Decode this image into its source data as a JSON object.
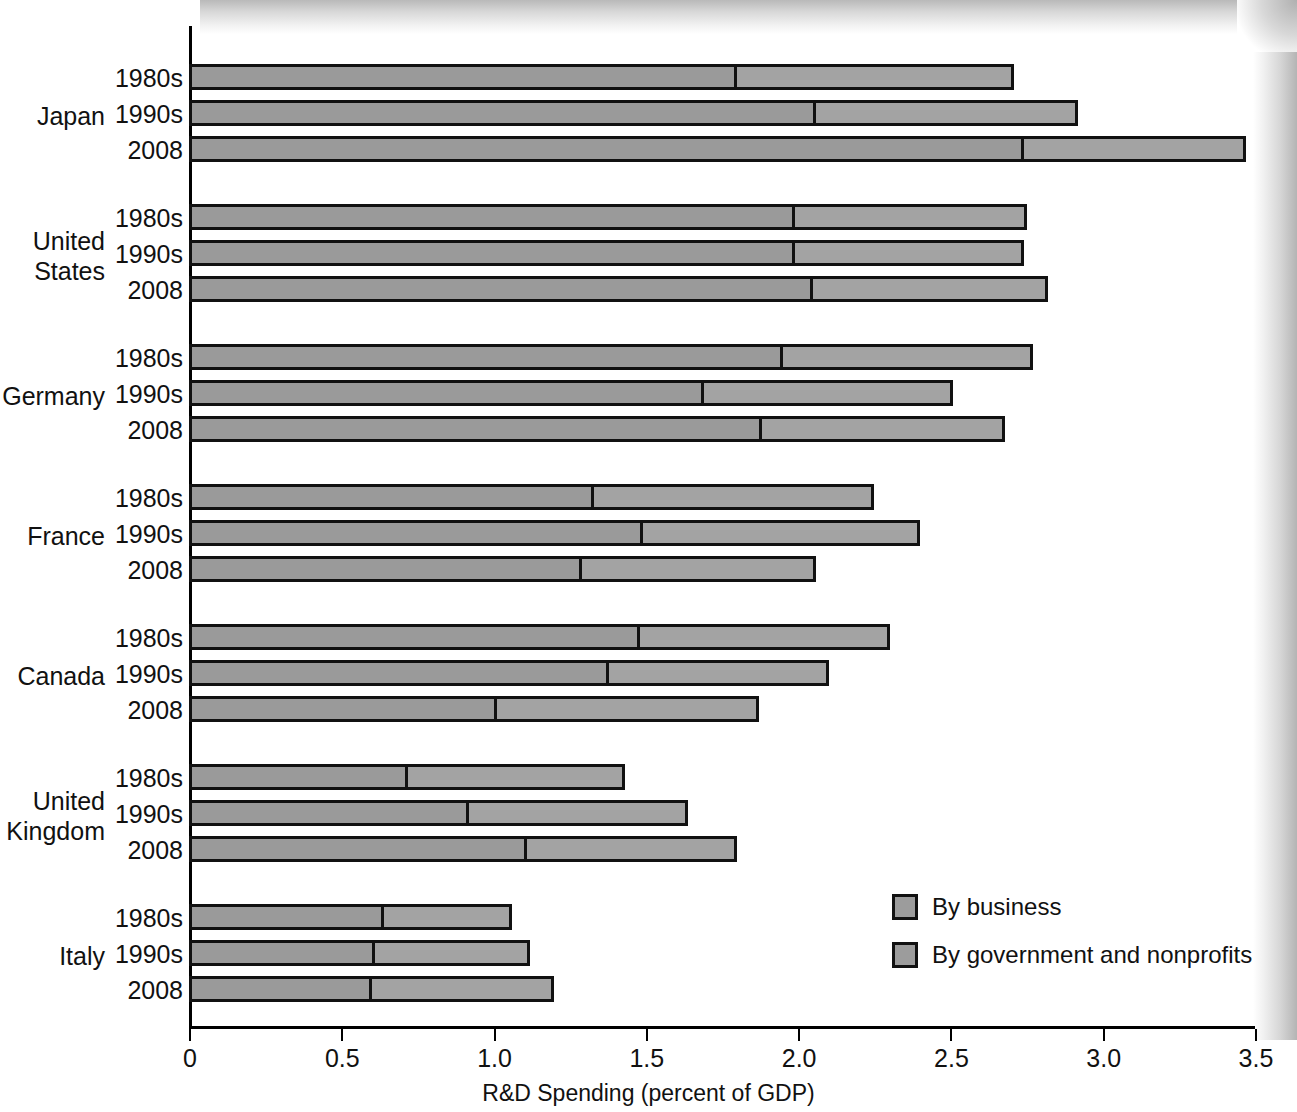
{
  "chart_data": {
    "type": "bar",
    "orientation": "horizontal",
    "stacked": true,
    "title": "",
    "xlabel": "R&D Spending (percent of GDP)",
    "ylabel": "",
    "xlim": [
      0,
      3.5
    ],
    "xticks": [
      "0",
      "0.5",
      "1.0",
      "1.5",
      "2.0",
      "2.5",
      "3.0",
      "3.5"
    ],
    "xtick_values": [
      0,
      0.5,
      1.0,
      1.5,
      2.0,
      2.5,
      3.0,
      3.5
    ],
    "grid": false,
    "legend_position": "lower-right",
    "series": [
      {
        "name": "By business",
        "key": "business",
        "color": "#9a9a9a"
      },
      {
        "name": "By government and nonprofits",
        "key": "government",
        "color": "#a3a3a3"
      }
    ],
    "groups": [
      {
        "country": "Japan",
        "rows": [
          {
            "period": "1980s",
            "business": 1.8,
            "government": 0.91,
            "total": 2.71
          },
          {
            "period": "1990s",
            "business": 2.06,
            "government": 0.86,
            "total": 2.92
          },
          {
            "period": "2008",
            "business": 2.74,
            "government": 0.73,
            "total": 3.47
          }
        ]
      },
      {
        "country": "United States",
        "rows": [
          {
            "period": "1980s",
            "business": 1.99,
            "government": 0.76,
            "total": 2.75
          },
          {
            "period": "1990s",
            "business": 1.99,
            "government": 0.75,
            "total": 2.74
          },
          {
            "period": "2008",
            "business": 2.05,
            "government": 0.77,
            "total": 2.82
          }
        ]
      },
      {
        "country": "Germany",
        "rows": [
          {
            "period": "1980s",
            "business": 1.95,
            "government": 0.82,
            "total": 2.77
          },
          {
            "period": "1990s",
            "business": 1.69,
            "government": 0.82,
            "total": 2.51
          },
          {
            "period": "2008",
            "business": 1.88,
            "government": 0.8,
            "total": 2.68
          }
        ]
      },
      {
        "country": "France",
        "rows": [
          {
            "period": "1980s",
            "business": 1.33,
            "government": 0.92,
            "total": 2.25
          },
          {
            "period": "1990s",
            "business": 1.49,
            "government": 0.91,
            "total": 2.4
          },
          {
            "period": "2008",
            "business": 1.29,
            "government": 0.77,
            "total": 2.06
          }
        ]
      },
      {
        "country": "Canada",
        "rows": [
          {
            "period": "1980s",
            "business": 1.48,
            "government": 0.82,
            "total": 2.3
          },
          {
            "period": "1990s",
            "business": 1.38,
            "government": 0.72,
            "total": 2.1
          },
          {
            "period": "2008",
            "business": 1.01,
            "government": 0.86,
            "total": 1.87
          }
        ]
      },
      {
        "country": "United Kingdom",
        "rows": [
          {
            "period": "1980s",
            "business": 0.72,
            "government": 0.71,
            "total": 1.43
          },
          {
            "period": "1990s",
            "business": 0.92,
            "government": 0.72,
            "total": 1.64
          },
          {
            "period": "2008",
            "business": 1.11,
            "government": 0.69,
            "total": 1.8
          }
        ]
      },
      {
        "country": "Italy",
        "rows": [
          {
            "period": "1980s",
            "business": 0.64,
            "government": 0.42,
            "total": 1.06
          },
          {
            "period": "1990s",
            "business": 0.61,
            "government": 0.51,
            "total": 1.12
          },
          {
            "period": "2008",
            "business": 0.6,
            "government": 0.6,
            "total": 1.2
          }
        ]
      }
    ]
  },
  "legend": {
    "items": [
      {
        "label": "By business"
      },
      {
        "label": "By government and nonprofits"
      }
    ]
  },
  "axis": {
    "x_title": "R&D Spending (percent of GDP)"
  }
}
